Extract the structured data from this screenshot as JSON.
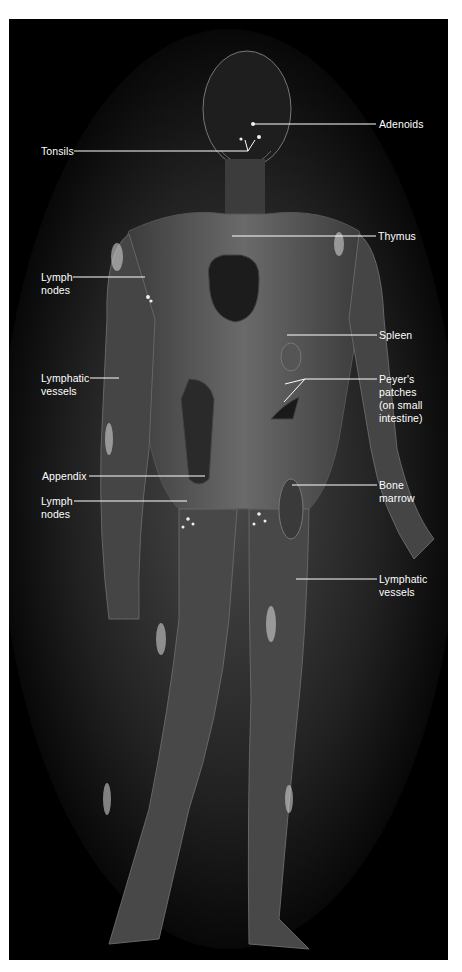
{
  "figure": {
    "background_color": "#000000",
    "body_color": "#5a5a5a",
    "label_color": "#ffffff"
  },
  "labels": {
    "adenoids": "Adenoids",
    "tonsils": "Tonsils",
    "thymus": "Thymus",
    "lymph_nodes_upper": "Lymph\nnodes",
    "spleen": "Spleen",
    "lymphatic_vessels_left": "Lymphatic\nvessels",
    "peyers_patches": "Peyer's\npatches\n(on small\nintestine)",
    "appendix": "Appendix",
    "bone_marrow": "Bone\nmarrow",
    "lymph_nodes_lower": "Lymph\nnodes",
    "lymphatic_vessels_right": "Lymphatic\nvessels"
  }
}
